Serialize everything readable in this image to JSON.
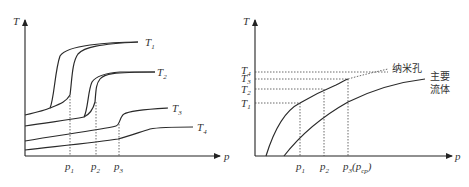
{
  "left_panel": {
    "y_axis_label": "T",
    "x_axis_label": "p",
    "curves": [
      {
        "label": "T",
        "sub": "1"
      },
      {
        "label": "T",
        "sub": "2"
      },
      {
        "label": "T",
        "sub": "3"
      },
      {
        "label": "T",
        "sub": "4"
      }
    ],
    "x_ticks": [
      {
        "label": "p",
        "sub": "1"
      },
      {
        "label": "p",
        "sub": "2"
      },
      {
        "label": "p",
        "sub": "3"
      }
    ]
  },
  "right_panel": {
    "y_axis_label": "T",
    "x_axis_label": "p",
    "y_ticks": [
      {
        "label": "T",
        "sub": "4"
      },
      {
        "label": "T",
        "sub": "3"
      },
      {
        "label": "T",
        "sub": "2"
      },
      {
        "label": "T",
        "sub": "1"
      }
    ],
    "x_ticks": [
      {
        "label": "p",
        "sub": "1"
      },
      {
        "label": "p",
        "sub": "2"
      },
      {
        "label": "p",
        "sub": "3",
        "extra": "(p",
        "extra_sub": "cp",
        "extra_close": ")"
      }
    ],
    "curve_nanopore_label": "纳米孔",
    "curve_bulk_label_line1": "主要",
    "curve_bulk_label_line2": "流体"
  }
}
